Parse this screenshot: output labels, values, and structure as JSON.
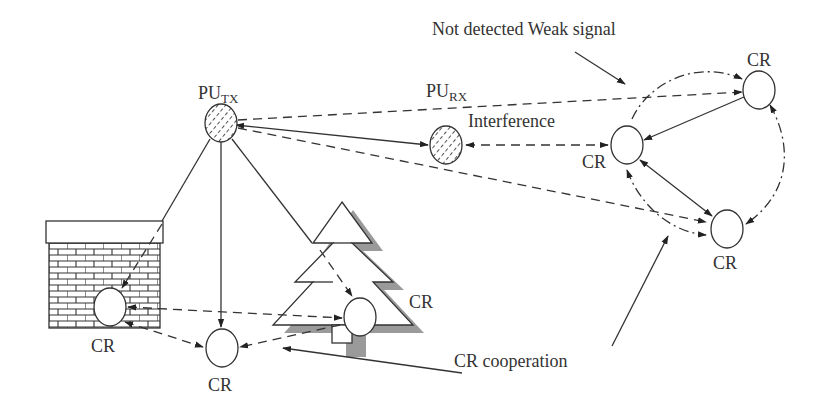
{
  "diagram": {
    "colors": {
      "line": "#333333",
      "shadow": "#9a9a9a",
      "background": "#ffffff"
    },
    "nodes": {
      "pu_tx": {
        "label_main": "PU",
        "label_sub": "TX",
        "kind": "primary-transmitter"
      },
      "pu_rx": {
        "label_main": "PU",
        "label_sub": "RX",
        "kind": "primary-receiver"
      },
      "cr_center": {
        "label": "CR"
      },
      "cr_top_right": {
        "label": "CR"
      },
      "cr_lower_right": {
        "label": "CR"
      },
      "cr_building": {
        "label": "CR"
      },
      "cr_bottom": {
        "label": "CR"
      },
      "cr_tree": {
        "label": "CR"
      }
    },
    "annotations": {
      "interference": "Interference",
      "not_detected": "Not detected Weak signal",
      "cooperation": "CR cooperation"
    },
    "obstacles": [
      {
        "name": "brick-building",
        "contains": "CR"
      },
      {
        "name": "pine-tree",
        "contains": "CR"
      }
    ],
    "legend_line_styles": {
      "solid": "primary signal path",
      "dashed": "weak / interference path",
      "dash-dot": "CR cooperation link"
    }
  }
}
